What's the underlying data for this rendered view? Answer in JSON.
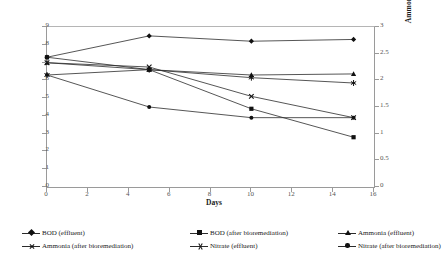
{
  "chart_data": {
    "type": "line",
    "title": "",
    "xlabel": "Days",
    "ylabel": "BOD (mg/L)",
    "ylabel_secondary": "Ammonia, Nitrate (mg/L)",
    "x": [
      0,
      5,
      10,
      15
    ],
    "xlim": [
      0,
      16
    ],
    "ylim": [
      0,
      9
    ],
    "ylim_secondary": [
      0,
      3
    ],
    "xticks": [
      "0",
      "2",
      "4",
      "6",
      "8",
      "10",
      "12",
      "14",
      "16"
    ],
    "yticks_left": [
      "0",
      "1",
      "2",
      "3",
      "4",
      "5",
      "6",
      "7",
      "8",
      "9"
    ],
    "yticks_right": [
      "0",
      "0.5",
      "1",
      "1.5",
      "2",
      "2.5",
      "3"
    ],
    "grid": false,
    "legend_position": "bottom",
    "series": [
      {
        "name": "BOD (effluent)",
        "axis": "left",
        "marker": "diamond",
        "values": [
          7.3,
          8.5,
          8.2,
          8.3
        ]
      },
      {
        "name": "BOD (after bioremediation)",
        "axis": "left",
        "marker": "square",
        "values": [
          7.3,
          6.6,
          4.4,
          2.8
        ]
      },
      {
        "name": "Ammonia (effluent)",
        "axis": "right",
        "marker": "triangle",
        "values": [
          2.33,
          2.2,
          2.1,
          2.12
        ]
      },
      {
        "name": "Ammonia (after bioremediation)",
        "axis": "right",
        "marker": "x",
        "values": [
          2.33,
          2.25,
          1.7,
          1.3
        ]
      },
      {
        "name": "Nitrate (effluent)",
        "axis": "right",
        "marker": "star",
        "values": [
          2.1,
          2.2,
          2.05,
          1.95
        ]
      },
      {
        "name": "Nitrate (after bioremediation)",
        "axis": "right",
        "marker": "circle",
        "values": [
          2.1,
          1.5,
          1.3,
          1.3
        ]
      }
    ],
    "colors": {
      "line": "#2b2b2b",
      "marker": "#111111",
      "axis": "#9a9a9a",
      "text": "#1a1a1a"
    }
  },
  "caption": ""
}
